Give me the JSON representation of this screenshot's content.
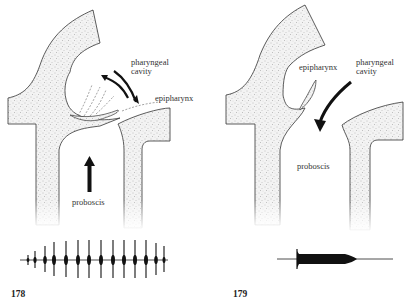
{
  "figures": [
    {
      "number": "178",
      "labels": {
        "pharyngeal_cavity_line1": "pharyngeal",
        "pharyngeal_cavity_line2": "cavity",
        "epipharynx": "epipharynx",
        "proboscis": "proboscis"
      },
      "description": "Epipharynx vibrating; double arrow indicates oscillation; upward arrow indicates flow from proboscis",
      "trace": "pulsed oscillogram with 14 pulses of rising then steady amplitude"
    },
    {
      "number": "179",
      "labels": {
        "epipharynx": "epipharynx",
        "pharyngeal_cavity_line1": "pharyngeal",
        "pharyngeal_cavity_line2": "cavity",
        "proboscis": "proboscis"
      },
      "description": "Epipharynx retracted; curved arrow indicates flow from pharyngeal cavity into proboscis",
      "trace": "continuous sound burst, tapering at end"
    }
  ],
  "colors": {
    "tissue_fill": "#f1f1f1",
    "stipple": "#9a9a9a",
    "outline": "#333333",
    "arrow": "#111111"
  }
}
